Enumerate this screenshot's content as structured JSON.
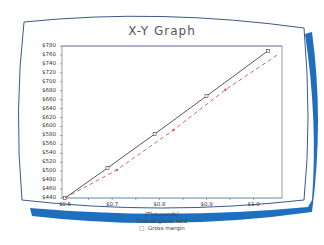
{
  "colors": {
    "bezel_blue": "#1f6fc0",
    "bezel_outline": "#3a5a8a",
    "cost_line": "#444444",
    "margin_line": "#e05050",
    "axis": "#666666"
  },
  "chart_data": {
    "type": "line",
    "title": "X-Y Graph",
    "xlabel": "(Thousands)",
    "ylabel": "",
    "x_ticks": [
      "$0.6",
      "$0.7",
      "$0.8",
      "$0.9",
      "$1.0"
    ],
    "y_ticks": [
      "$780",
      "$760",
      "$740",
      "$720",
      "$700",
      "$680",
      "$660",
      "$640",
      "$620",
      "$600",
      "$580",
      "$560",
      "$540",
      "$520",
      "$500",
      "$480",
      "$460",
      "$440"
    ],
    "xlim": [
      0.6,
      1.05
    ],
    "ylim": [
      440,
      780
    ],
    "legend": [
      "Cost of goods sold",
      "Gross margin"
    ],
    "legend_position": "bottom",
    "grid": false,
    "series": [
      {
        "name": "Cost of goods sold",
        "style": "solid",
        "x": [
          0.6,
          0.69,
          0.79,
          0.9,
          1.03
        ],
        "y": [
          440,
          507,
          583,
          668,
          769
        ]
      },
      {
        "name": "Gross margin",
        "style": "dashed",
        "x": [
          0.6,
          0.71,
          0.83,
          0.94,
          1.05
        ],
        "y": [
          440,
          503,
          592,
          682,
          760
        ]
      }
    ]
  },
  "labels": {
    "title": "X-Y Graph",
    "x_units": "(Thousands)",
    "legend_1": "Cost of goods sold",
    "legend_2": "Gross margin",
    "legend_2_marker": "□"
  }
}
